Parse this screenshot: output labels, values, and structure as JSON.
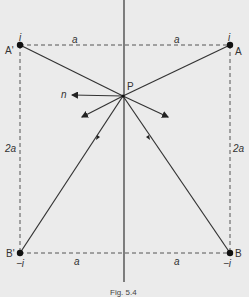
{
  "diagram": {
    "points": {
      "A_prime": {
        "label": "A'",
        "charge": "i"
      },
      "A": {
        "label": "A",
        "charge": "i"
      },
      "B_prime": {
        "label": "B'",
        "charge": "−i"
      },
      "B": {
        "label": "B",
        "charge": "−i"
      },
      "P": {
        "label": "P"
      }
    },
    "dimensions": {
      "top_left": "a",
      "top_right": "a",
      "bottom_left": "a",
      "bottom_right": "a",
      "left_side": "2a",
      "right_side": "2a"
    },
    "normal_label": "n",
    "caption": "Fig. 5.4"
  }
}
